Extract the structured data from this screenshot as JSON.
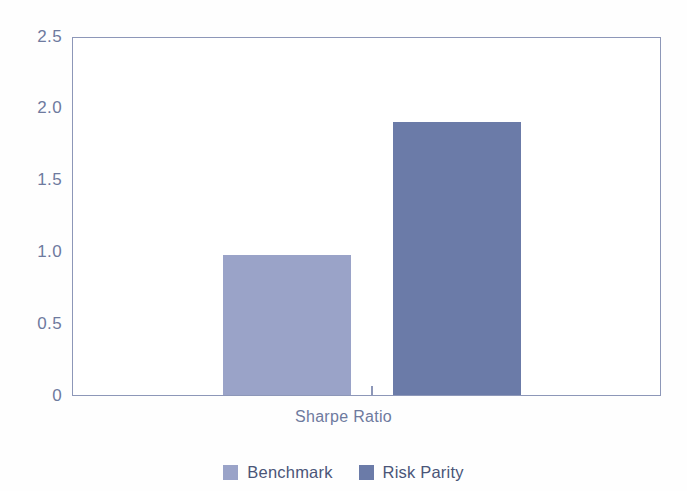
{
  "chart_data": {
    "type": "bar",
    "title": "",
    "subtitle": "",
    "xlabel": "Sharpe Ratio",
    "ylabel": "",
    "categories": [
      "Sharpe Ratio"
    ],
    "series": [
      {
        "name": "Benchmark",
        "values": [
          0.98
        ],
        "color": "#9aa3c8"
      },
      {
        "name": "Risk Parity",
        "values": [
          1.92
        ],
        "color": "#6b7ba8"
      }
    ],
    "ylim": [
      0,
      2.5
    ],
    "yticks": [
      "0",
      "0.5",
      "1.0",
      "1.5",
      "2.0",
      "2.5"
    ],
    "ytick_values": [
      0,
      0.5,
      1.0,
      1.5,
      2.0,
      2.5
    ],
    "grid": false,
    "legend_position": "bottom",
    "frame": true
  },
  "axes": {
    "y_ticks": [
      {
        "label": "2.5",
        "value": 2.5
      },
      {
        "label": "2.0",
        "value": 2.0
      },
      {
        "label": "1.5",
        "value": 1.5
      },
      {
        "label": "1.0",
        "value": 1.0
      },
      {
        "label": "0.5",
        "value": 0.5
      },
      {
        "label": "0",
        "value": 0
      }
    ],
    "x_label": "Sharpe Ratio"
  },
  "bars": [
    {
      "name": "Benchmark",
      "value": 0.98,
      "color": "#9aa3c8"
    },
    {
      "name": "Risk Parity",
      "value": 1.92,
      "color": "#6b7ba8"
    }
  ],
  "legend": {
    "items": [
      {
        "label": "Benchmark",
        "color": "#9aa3c8"
      },
      {
        "label": "Risk Parity",
        "color": "#6b7ba8"
      }
    ]
  },
  "style": {
    "background": "#fefefe",
    "axis_color": "#8d97b8",
    "tick_text_color": "#6e7a9e",
    "legend_text_color": "#4a5578"
  }
}
